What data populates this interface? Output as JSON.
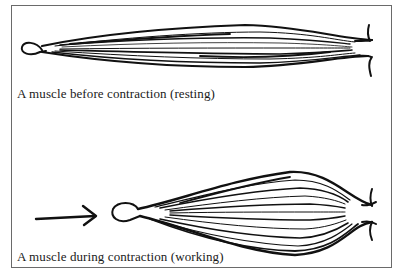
{
  "diagram": {
    "panels": [
      {
        "id": "resting",
        "caption": "A muscle before contraction (resting)",
        "shape": "long-thin-spindle"
      },
      {
        "id": "working",
        "caption": "A muscle during contraction (working)",
        "shape": "short-fat-spindle",
        "arrow": "right-arrow"
      }
    ],
    "colors": {
      "ink": "#111111",
      "border": "#6a6a6a",
      "background": "#ffffff"
    }
  }
}
